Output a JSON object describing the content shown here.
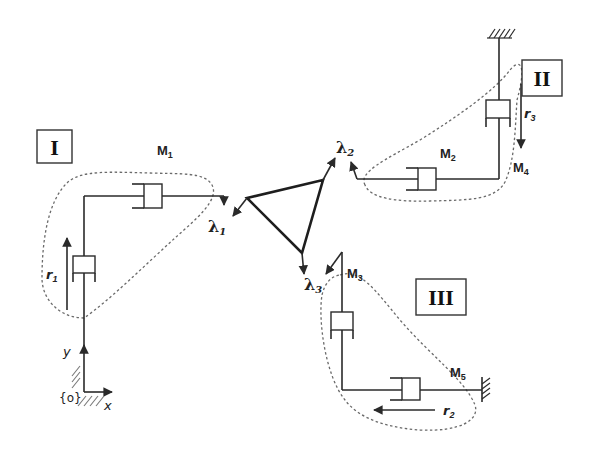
{
  "figure": {
    "chains": [
      {
        "id": "I",
        "label": "I",
        "module_label": "M",
        "module_sub": "1",
        "joint_variable": "r",
        "joint_sub": "1",
        "force_label": "λ",
        "force_sub": "1"
      },
      {
        "id": "II",
        "label": "II",
        "module_labels": [
          {
            "base": "M",
            "sub": "2"
          },
          {
            "base": "M",
            "sub": "4"
          }
        ],
        "joint_variable": "r",
        "joint_sub": "3",
        "force_label": "λ",
        "force_sub": "2"
      },
      {
        "id": "III",
        "label": "III",
        "module_labels": [
          {
            "base": "M",
            "sub": "3"
          },
          {
            "base": "M",
            "sub": "5"
          }
        ],
        "joint_variable": "r",
        "joint_sub": "2",
        "force_label": "λ",
        "force_sub": "3"
      }
    ],
    "frame": {
      "origin_label": "{o}",
      "x_label": "x",
      "y_label": "y"
    }
  },
  "labels": {
    "box_I": "I",
    "box_II": "II",
    "box_III": "III",
    "M1": {
      "base": "M",
      "sub": "1"
    },
    "M2": {
      "base": "M",
      "sub": "2"
    },
    "M3": {
      "base": "M",
      "sub": "3"
    },
    "M4": {
      "base": "M",
      "sub": "4"
    },
    "M5": {
      "base": "M",
      "sub": "5"
    },
    "r1": {
      "base": "r",
      "sub": "1"
    },
    "r2": {
      "base": "r",
      "sub": "2"
    },
    "r3": {
      "base": "r",
      "sub": "3"
    },
    "lambda1": {
      "base": "λ",
      "sub": "1"
    },
    "lambda2": {
      "base": "λ",
      "sub": "2"
    },
    "lambda3": {
      "base": "λ",
      "sub": "3"
    },
    "origin": "{o}",
    "x_axis": "x",
    "y_axis": "y"
  },
  "colors": {
    "ink": "#2a2a2a",
    "dashed_outline": "#6a6a6a",
    "background": "#ffffff"
  }
}
